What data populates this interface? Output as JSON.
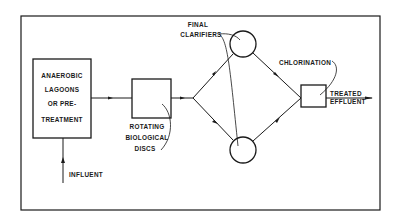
{
  "diagram": {
    "type": "process-flow",
    "colors": {
      "line": "#1a1a1a",
      "background": "#ffffff"
    },
    "nodes": {
      "pretreatment": {
        "lines": [
          "ANAEROBIC",
          "LAGOONS",
          "OR PRE-",
          "TREATMENT"
        ]
      },
      "rbd": {
        "lines": [
          "ROTATING",
          "BIOLOGICAL",
          "DISCS"
        ]
      },
      "clarifiers": {
        "lines": [
          "FINAL",
          "CLARIFIERS"
        ]
      },
      "chlorination": {
        "label": "CHLORINATION"
      }
    },
    "inputs": {
      "influent": "INFLUENT"
    },
    "outputs": {
      "effluent_lines": [
        "TREATED",
        "EFFLUENT"
      ]
    }
  }
}
